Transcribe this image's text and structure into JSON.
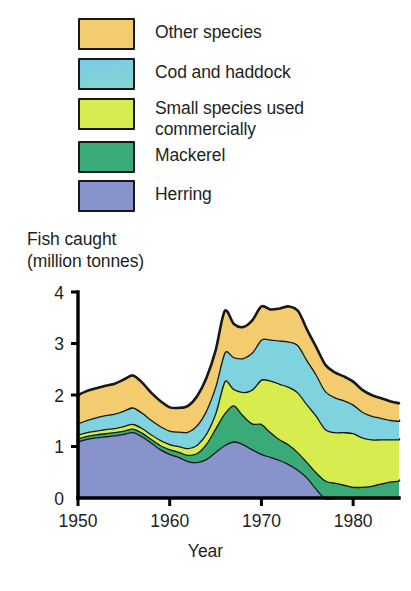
{
  "legend": {
    "items": [
      {
        "label": "Other species",
        "color": "#f2cc6e",
        "key": "other"
      },
      {
        "label": "Cod and haddock",
        "color": "#7fd3de",
        "key": "cod"
      },
      {
        "label": "Small species used\ncommercially",
        "color": "#d7ec4e",
        "key": "small"
      },
      {
        "label": "Mackerel",
        "color": "#3aab78",
        "key": "mackerel"
      },
      {
        "label": "Herring",
        "color": "#8793ca",
        "key": "herring"
      }
    ]
  },
  "axes": {
    "y_title": "Fish caught\n(million tonnes)",
    "x_title": "Year",
    "y_ticks": [
      "0",
      "1",
      "2",
      "3",
      "4"
    ],
    "x_ticks": [
      "1950",
      "1960",
      "1970",
      "1980"
    ]
  },
  "chart_data": {
    "type": "area",
    "stacked": true,
    "title": "Fish caught (million tonnes)",
    "xlabel": "Year",
    "ylabel": "Fish caught (million tonnes)",
    "xlim": [
      1950,
      1985
    ],
    "ylim": [
      0,
      4
    ],
    "grid": false,
    "legend_position": "top-left",
    "axis_color": "#000000",
    "outline_color": "#17181a",
    "x": [
      1950,
      1951,
      1952,
      1953,
      1954,
      1955,
      1956,
      1957,
      1958,
      1959,
      1960,
      1961,
      1962,
      1963,
      1964,
      1965,
      1966,
      1967,
      1968,
      1969,
      1970,
      1971,
      1972,
      1973,
      1974,
      1975,
      1976,
      1977,
      1978,
      1979,
      1980,
      1981,
      1982,
      1983,
      1984,
      1985
    ],
    "series": [
      {
        "name": "Herring",
        "color": "#8793ca",
        "order": 1,
        "values": [
          1.1,
          1.15,
          1.18,
          1.2,
          1.22,
          1.25,
          1.28,
          1.2,
          1.08,
          0.95,
          0.86,
          0.8,
          0.72,
          0.7,
          0.76,
          0.9,
          1.03,
          1.1,
          1.05,
          0.95,
          0.86,
          0.8,
          0.74,
          0.66,
          0.55,
          0.4,
          0.18,
          0.0,
          0.0,
          0.0,
          0.0,
          0.0,
          0.0,
          0.0,
          0.0,
          0.0
        ]
      },
      {
        "name": "Mackerel",
        "color": "#3aab78",
        "order": 2,
        "values": [
          0.06,
          0.06,
          0.06,
          0.06,
          0.06,
          0.06,
          0.07,
          0.07,
          0.07,
          0.08,
          0.09,
          0.1,
          0.12,
          0.18,
          0.3,
          0.46,
          0.62,
          0.7,
          0.56,
          0.5,
          0.58,
          0.48,
          0.4,
          0.38,
          0.34,
          0.3,
          0.32,
          0.34,
          0.3,
          0.26,
          0.22,
          0.22,
          0.24,
          0.28,
          0.32,
          0.34
        ]
      },
      {
        "name": "Small species used commercially",
        "color": "#d7ec4e",
        "order": 3,
        "values": [
          0.07,
          0.07,
          0.07,
          0.08,
          0.08,
          0.09,
          0.09,
          0.09,
          0.09,
          0.1,
          0.1,
          0.11,
          0.13,
          0.16,
          0.2,
          0.3,
          0.62,
          0.32,
          0.45,
          0.66,
          0.86,
          1.0,
          1.08,
          1.12,
          1.16,
          1.12,
          1.1,
          1.0,
          0.98,
          1.02,
          1.04,
          0.96,
          0.9,
          0.86,
          0.82,
          0.8
        ]
      },
      {
        "name": "Cod and haddock",
        "color": "#7fd3de",
        "order": 4,
        "values": [
          0.22,
          0.24,
          0.26,
          0.27,
          0.28,
          0.3,
          0.32,
          0.3,
          0.28,
          0.27,
          0.26,
          0.28,
          0.32,
          0.38,
          0.45,
          0.52,
          0.56,
          0.62,
          0.66,
          0.72,
          0.78,
          0.8,
          0.84,
          0.88,
          0.92,
          0.86,
          0.8,
          0.74,
          0.68,
          0.62,
          0.56,
          0.5,
          0.46,
          0.42,
          0.38,
          0.36
        ]
      },
      {
        "name": "Other species",
        "color": "#f2cc6e",
        "order": 5,
        "values": [
          0.55,
          0.56,
          0.56,
          0.57,
          0.58,
          0.6,
          0.62,
          0.58,
          0.52,
          0.48,
          0.45,
          0.46,
          0.5,
          0.56,
          0.62,
          0.68,
          0.8,
          0.64,
          0.6,
          0.62,
          0.64,
          0.58,
          0.62,
          0.68,
          0.66,
          0.58,
          0.52,
          0.5,
          0.48,
          0.46,
          0.44,
          0.42,
          0.4,
          0.38,
          0.36,
          0.34
        ]
      }
    ],
    "totals": [
      2.0,
      2.08,
      2.13,
      2.18,
      2.22,
      2.3,
      2.38,
      2.24,
      2.04,
      1.88,
      1.76,
      1.75,
      1.79,
      1.98,
      2.33,
      2.86,
      3.63,
      3.38,
      3.32,
      3.45,
      3.72,
      3.66,
      3.68,
      3.72,
      3.63,
      3.26,
      2.92,
      2.58,
      2.44,
      2.36,
      2.26,
      2.1,
      2.0,
      1.94,
      1.88,
      1.84
    ]
  }
}
